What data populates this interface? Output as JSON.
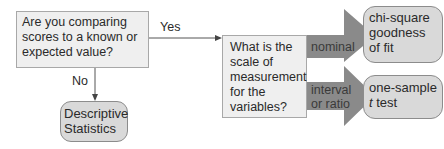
{
  "diagram": {
    "type": "decision-flowchart",
    "colors": {
      "question_fill": "#efefef",
      "result_fill": "#d9d9d9",
      "arrow_fill": "#8a8a8a",
      "line": "#555555"
    },
    "start_question": {
      "text": "Are you comparing scores to a known or expected value?"
    },
    "branch_yes": {
      "label": "Yes"
    },
    "branch_no": {
      "label": "No"
    },
    "no_result": {
      "line1": "Descriptive",
      "line2": "Statistics"
    },
    "scale_question": {
      "text": "What is the scale of measurement for the variables?"
    },
    "scale_options": [
      {
        "label_line1": "nominal",
        "label_line2": "",
        "result_line1": "chi-square",
        "result_line2": "goodness",
        "result_line3": "of fit"
      },
      {
        "label_line1": "interval",
        "label_line2": "or ratio",
        "result_line1": "one-sample",
        "result_line2_italic": "t",
        "result_line2_rest": " test"
      }
    ]
  }
}
